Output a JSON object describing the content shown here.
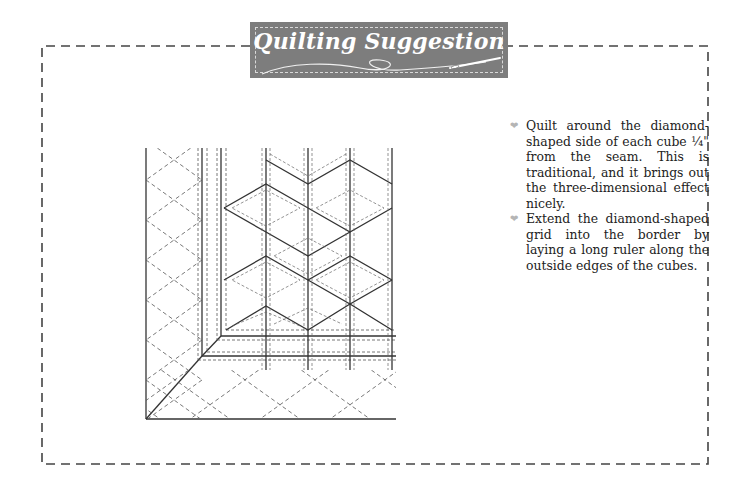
{
  "banner": {
    "title": "Quilting Suggestion",
    "background_color": "#7d7d7d",
    "text_color": "#ffffff",
    "icon": "needle-and-thread-icon"
  },
  "frame": {
    "border_style": "dashed",
    "border_color": "#444444"
  },
  "illustration": {
    "description": "Tumbling-block (cube) quilt corner with diamond quilting grid extended into the border",
    "stroke_color": "#333333"
  },
  "tips": {
    "bullet_icon": "heart-icon",
    "bullet_color": "#b5b5b5",
    "items": [
      {
        "text": "Quilt around the diamond-shaped side of each cube ¼\" from the seam. This is traditional, and it brings out the three-dimensional effect nicely."
      },
      {
        "text": "Extend the diamond-shaped grid into the border by laying a long ruler along the outside edges of the cubes."
      }
    ]
  }
}
